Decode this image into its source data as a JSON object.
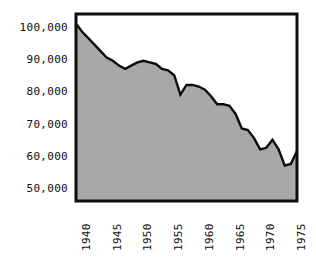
{
  "chart_data": {
    "type": "area",
    "title": "",
    "subtitle": "",
    "xlabel": "",
    "ylabel": "",
    "grid": false,
    "legend": "none",
    "fill_color": "#a8a8a8",
    "line_color": "#0d0d0d",
    "frame_color": "#0d0d0d",
    "background_color": "#ffffff",
    "xlim": [
      1940,
      1976
    ],
    "ylim": [
      46000,
      104000
    ],
    "x_tick_labels": [
      "1940",
      "1945",
      "1950",
      "1955",
      "1960",
      "1965",
      "1970",
      "1975"
    ],
    "x_ticks": [
      1940,
      1945,
      1950,
      1955,
      1960,
      1965,
      1970,
      1975
    ],
    "y_tick_labels": [
      "100,000",
      "90,000",
      "80,000",
      "70,000",
      "60,000",
      "50,000"
    ],
    "y_ticks": [
      100000,
      90000,
      80000,
      70000,
      60000,
      50000
    ],
    "x": [
      1940,
      1941,
      1942,
      1943,
      1944,
      1945,
      1946,
      1947,
      1948,
      1949,
      1950,
      1951,
      1952,
      1953,
      1954,
      1955,
      1956,
      1957,
      1958,
      1959,
      1960,
      1961,
      1962,
      1963,
      1964,
      1965,
      1966,
      1967,
      1968,
      1969,
      1970,
      1971,
      1972,
      1973,
      1974,
      1975,
      1976
    ],
    "values": [
      101000,
      98500,
      96500,
      94500,
      92500,
      90500,
      89500,
      88000,
      87000,
      88000,
      89000,
      89500,
      89000,
      88500,
      87000,
      86500,
      85000,
      79000,
      82000,
      82000,
      81500,
      80500,
      78500,
      76000,
      76000,
      75500,
      73000,
      68500,
      68000,
      65500,
      62000,
      62500,
      65000,
      62000,
      57000,
      57500,
      61500
    ]
  }
}
